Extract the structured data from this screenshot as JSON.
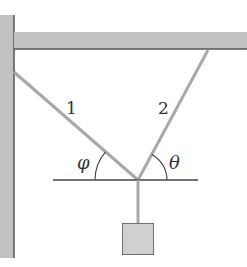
{
  "diagram": {
    "type": "physics-statics",
    "labels": {
      "string_1": "1",
      "string_2": "2",
      "angle_left": "φ",
      "angle_right": "θ"
    },
    "colors": {
      "structure_fill": "#c4c4c4",
      "structure_edge": "#555555",
      "string": "#a8a8a8",
      "line": "#444444",
      "mass_fill": "#d2d2d2"
    }
  }
}
